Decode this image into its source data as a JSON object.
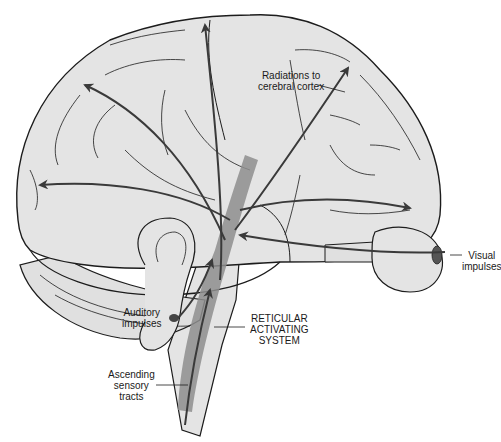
{
  "figure": {
    "colors": {
      "brain_fill": "#e4e4e4",
      "outline": "#1c1c1c",
      "ras_band": "#8e8e8e",
      "arrow": "#3a3a3a",
      "background": "#ffffff"
    }
  },
  "labels": {
    "radiations": {
      "line1": "Radiations to",
      "line2": "cerebral cortex"
    },
    "visual": {
      "line1": "Visual",
      "line2": "impulses"
    },
    "auditory": {
      "line1": "Auditory",
      "line2": "impulses"
    },
    "ras": {
      "line1": "RETICULAR",
      "line2": "ACTIVATING",
      "line3": "SYSTEM"
    },
    "ascending": {
      "line1": "Ascending",
      "line2": "sensory",
      "line3": "tracts"
    }
  }
}
